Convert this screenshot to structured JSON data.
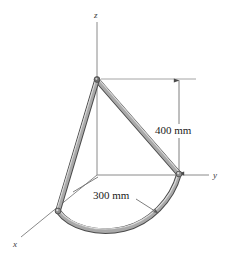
{
  "figure": {
    "background_color": "#ffffff",
    "axes": {
      "x": {
        "label": "x",
        "label_x": 16,
        "label_y": 243,
        "tip_x": 22,
        "tip_y": 236,
        "origin_x": 97,
        "origin_y": 175
      },
      "y": {
        "label": "y",
        "label_x": 216,
        "label_y": 174,
        "tip_x": 209,
        "tip_y": 175,
        "origin_x": 97,
        "origin_y": 175
      },
      "z": {
        "label": "z",
        "label_x": 95,
        "label_y": 17,
        "tip_x": 97,
        "tip_y": 22,
        "origin_x": 97,
        "origin_y": 175
      },
      "color": "#808080"
    },
    "dimensions": [
      {
        "name": "height-dimension",
        "label": "400 mm",
        "label_x": 176,
        "label_y": 130,
        "line_x": 179,
        "top_y": 79,
        "bottom_y": 175,
        "ext_top_from_x": 100,
        "ext_top_to_x": 196,
        "ext_top_y": 79,
        "color": "#6e6e6e"
      },
      {
        "name": "radius-dimension",
        "label": "300 mm",
        "label_x": 124,
        "label_y": 196,
        "leader_left_x1": 97,
        "leader_left_y1": 176,
        "leader_left_x2": 70,
        "leader_left_y2": 193,
        "leader_right_x1": 133,
        "leader_right_y1": 198,
        "leader_right_x2": 157,
        "leader_right_y2": 212,
        "color": "#6e6e6e"
      }
    ],
    "rod": {
      "name": "bent-rod",
      "stroke_dark": "#4f4f4f",
      "fill_light": "#a8a8a8",
      "highlight": "#d8d8d8",
      "thickness_px": 5,
      "apex_x": 97,
      "apex_y": 79,
      "end_y_axis_x": 179,
      "end_y_axis_y": 174,
      "end_x_axis_x": 58,
      "end_x_axis_y": 211,
      "arc_bottom_x": 124,
      "arc_bottom_y": 229
    },
    "construction_lines": {
      "color": "#909090",
      "vertical_apex_to_origin": {
        "x": 97,
        "y1": 79,
        "y2": 175
      },
      "origin_to_y_end": {
        "x1": 97,
        "y1": 175,
        "x2": 179,
        "y2": 175
      }
    }
  }
}
